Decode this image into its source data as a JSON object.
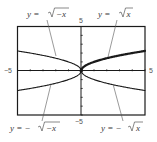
{
  "chart_data": {
    "type": "line",
    "title": "",
    "xlabel": "",
    "ylabel": "",
    "xlim": [
      -5,
      5
    ],
    "ylim": [
      -5,
      5
    ],
    "grid": false,
    "xticks_step": 1,
    "yticks_step": 1,
    "tick_labels": {
      "x_min": "−5",
      "x_max": "5",
      "y_min": "−5",
      "y_max": "5"
    },
    "series": [
      {
        "name": "y = √(−x)",
        "label": "y = √−x",
        "domain": [
          -5,
          0
        ],
        "expr": "sqrt(-x)",
        "emphasis": false,
        "points": [
          [
            -5,
            2.236
          ],
          [
            -4,
            2.0
          ],
          [
            -3,
            1.732
          ],
          [
            -2,
            1.414
          ],
          [
            -1,
            1.0
          ],
          [
            0,
            0
          ]
        ]
      },
      {
        "name": "y = √x",
        "label": "y = √x",
        "domain": [
          0,
          5
        ],
        "expr": "sqrt(x)",
        "emphasis": true,
        "points": [
          [
            0,
            0
          ],
          [
            1,
            1.0
          ],
          [
            2,
            1.414
          ],
          [
            3,
            1.732
          ],
          [
            4,
            2.0
          ],
          [
            5,
            2.236
          ]
        ]
      },
      {
        "name": "y = −√(−x)",
        "label": "y = −√−x",
        "domain": [
          -5,
          0
        ],
        "expr": "-sqrt(-x)",
        "emphasis": false,
        "points": [
          [
            -5,
            -2.236
          ],
          [
            -4,
            -2.0
          ],
          [
            -3,
            -1.732
          ],
          [
            -2,
            -1.414
          ],
          [
            -1,
            -1.0
          ],
          [
            0,
            0
          ]
        ]
      },
      {
        "name": "y = −√x",
        "label": "y = −√x",
        "domain": [
          0,
          5
        ],
        "expr": "-sqrt(x)",
        "emphasis": false,
        "points": [
          [
            0,
            0
          ],
          [
            1,
            -1.0
          ],
          [
            2,
            -1.414
          ],
          [
            3,
            -1.732
          ],
          [
            4,
            -2.0
          ],
          [
            5,
            -2.236
          ]
        ]
      }
    ],
    "annotations": [
      {
        "text": "y = √−x",
        "series": 0,
        "position": "top-left"
      },
      {
        "text": "y = √x",
        "series": 1,
        "position": "top-right"
      },
      {
        "text": "y = −√−x",
        "series": 2,
        "position": "bottom-left"
      },
      {
        "text": "y = −√x",
        "series": 3,
        "position": "bottom-right"
      }
    ]
  },
  "labels": {
    "top_left": {
      "prefix": "y = ",
      "radicand": "−x"
    },
    "top_right": {
      "prefix": "y = ",
      "radicand": "x"
    },
    "bottom_left": {
      "prefix": "y = −",
      "radicand": "−x"
    },
    "bottom_right": {
      "prefix": "y = −",
      "radicand": "x"
    }
  },
  "colors": {
    "frame": "#1a1a1a",
    "axis": "#1a1a1a",
    "curve": "#1a1a1a",
    "leader": "#555555",
    "text": "#3a3a3a"
  }
}
